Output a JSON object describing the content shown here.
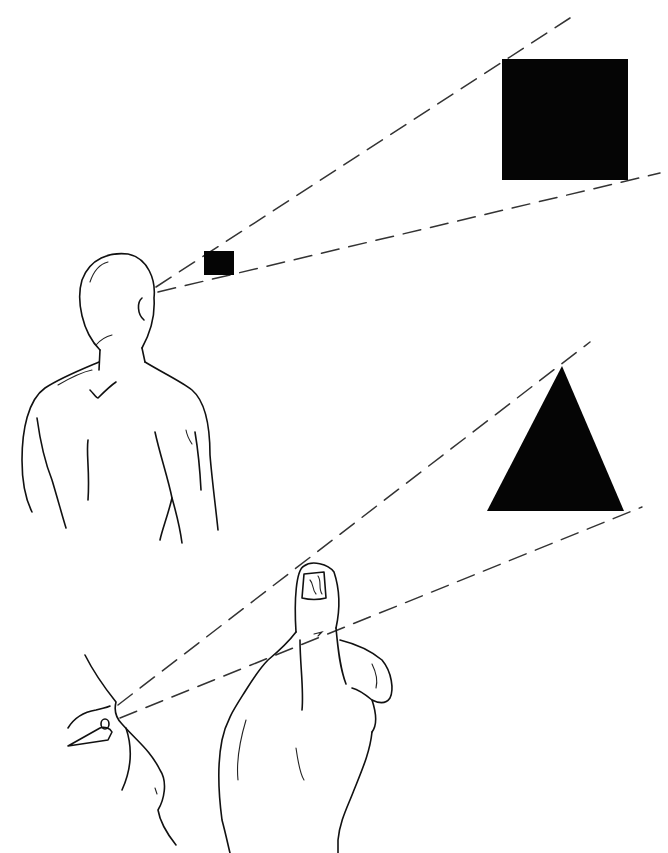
{
  "illustration": {
    "subject": "Size perception: visual angle",
    "panel_top": {
      "description": "Man seen from behind; near small square and far large square subtend the same visual angle",
      "near_object": {
        "shape": "square",
        "size": "small",
        "color": "#050505"
      },
      "far_object": {
        "shape": "square",
        "size": "large",
        "color": "#050505"
      }
    },
    "panel_bottom": {
      "description": "Eye looking past a raised thumb; thumb occludes a distant triangle within the same sight lines",
      "near_object": {
        "shape": "thumb"
      },
      "far_object": {
        "shape": "triangle",
        "color": "#050505"
      }
    },
    "line_color": "#111111",
    "background": "#ffffff"
  }
}
